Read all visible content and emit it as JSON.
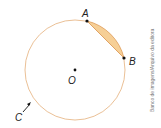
{
  "diagram": {
    "type": "circle-geometry",
    "circle": {
      "center_label": "O",
      "stroke_color": "#e8b98a"
    },
    "points": [
      {
        "label": "A"
      },
      {
        "label": "B"
      },
      {
        "label": "O"
      }
    ],
    "arc_label": "C",
    "segment_fill_color": "#f6cf96",
    "credit": "Banco de imagens/Arquivo da editora"
  }
}
